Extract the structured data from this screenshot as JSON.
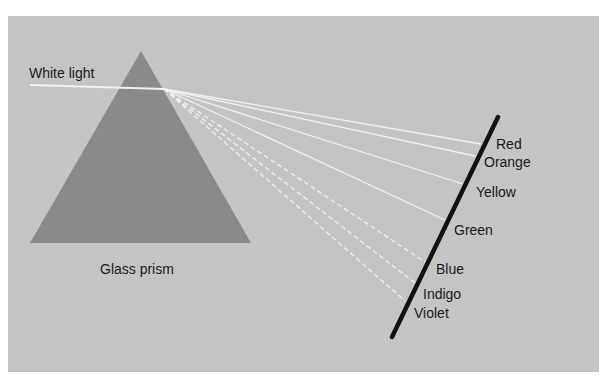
{
  "labels": {
    "white_light": "White light",
    "prism": "Glass prism"
  },
  "spectrum": [
    {
      "name": "Red",
      "end": [
        481,
        144
      ],
      "label_pos": [
        496,
        137
      ],
      "dashed": false
    },
    {
      "name": "Orange",
      "end": [
        475,
        156
      ],
      "label_pos": [
        484,
        155
      ],
      "dashed": false
    },
    {
      "name": "Yellow",
      "end": [
        463,
        184
      ],
      "label_pos": [
        476,
        185
      ],
      "dashed": false
    },
    {
      "name": "Green",
      "end": [
        445,
        220
      ],
      "label_pos": [
        454,
        223
      ],
      "dashed": false
    },
    {
      "name": "Blue",
      "end": [
        425,
        262
      ],
      "label_pos": [
        436,
        262
      ],
      "dashed": true
    },
    {
      "name": "Indigo",
      "end": [
        415,
        283
      ],
      "label_pos": [
        423,
        287
      ],
      "dashed": true
    },
    {
      "name": "Violet",
      "end": [
        405,
        301
      ],
      "label_pos": [
        414,
        306
      ],
      "dashed": true
    }
  ],
  "geometry": {
    "prism": {
      "apex": [
        141,
        51
      ],
      "base_left": [
        30,
        243
      ],
      "base_right": [
        251,
        243
      ]
    },
    "incident_ray": {
      "start": [
        30,
        85
      ],
      "end": [
        164,
        89
      ]
    },
    "dispersion_origin": [
      164,
      89
    ],
    "screen": {
      "top": [
        498,
        117
      ],
      "bottom": [
        392,
        337
      ]
    }
  },
  "colors": {
    "background": "#c4c4c4",
    "prism": "#8a8a8a",
    "ray": "#f2f2f2",
    "screen": "#111111",
    "text": "#1a1a1a"
  }
}
